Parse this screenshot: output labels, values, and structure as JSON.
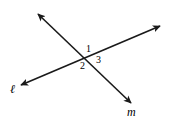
{
  "figure": {
    "background_color": "#ffffff",
    "stroke_color": "#1a1a1a",
    "stroke_width": 1.6,
    "width": 169,
    "height": 122,
    "angle_labels": [
      {
        "text": "1",
        "x": 86,
        "y": 44
      },
      {
        "text": "2",
        "x": 80,
        "y": 61
      },
      {
        "text": "3",
        "x": 96,
        "y": 55
      }
    ],
    "line_labels": [
      {
        "text": "ℓ",
        "x": 10,
        "y": 83
      },
      {
        "text": "m",
        "x": 127,
        "y": 106
      }
    ],
    "lines": [
      {
        "name": "line-m",
        "label": "m",
        "from": {
          "x": 38,
          "y": 14
        },
        "to": {
          "x": 131,
          "y": 103
        },
        "arrow_start": true,
        "arrow_end": true
      },
      {
        "name": "line-l",
        "label": "ℓ",
        "from": {
          "x": 21,
          "y": 85
        },
        "to": {
          "x": 160,
          "y": 26
        },
        "arrow_start": true,
        "arrow_end": true
      }
    ],
    "intersection": {
      "x": 88,
      "y": 58
    }
  }
}
